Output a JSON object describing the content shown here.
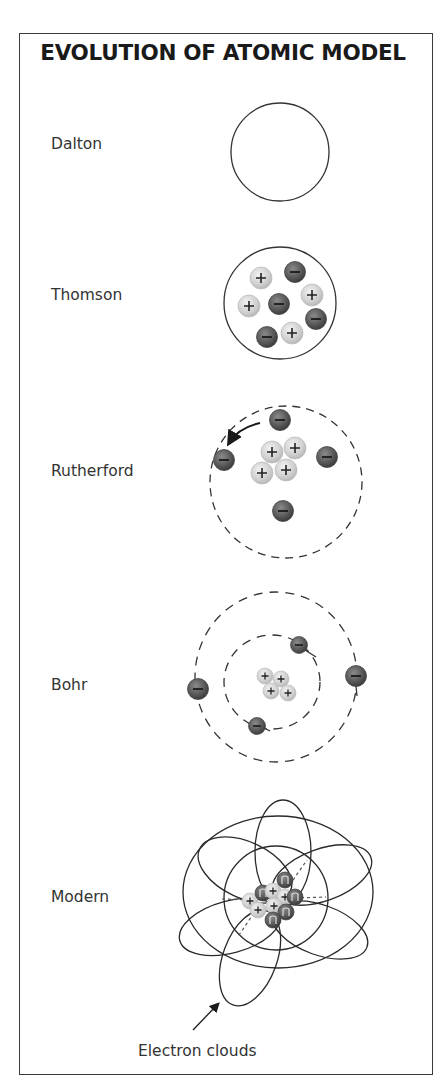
{
  "title": "EVOLUTION OF ATOMIC MODEL",
  "models": [
    {
      "name": "Dalton"
    },
    {
      "name": "Thomson"
    },
    {
      "name": "Rutherford"
    },
    {
      "name": "Bohr"
    },
    {
      "name": "Modern"
    }
  ],
  "annotation": "Electron clouds",
  "symbols": {
    "proton": "+",
    "electron": "−",
    "neutron": "n"
  },
  "colors": {
    "border": "#3a3a3a",
    "proton_fill": "#d9d9d9",
    "electron_fill": "#5a5a5a",
    "line": "#333333"
  }
}
